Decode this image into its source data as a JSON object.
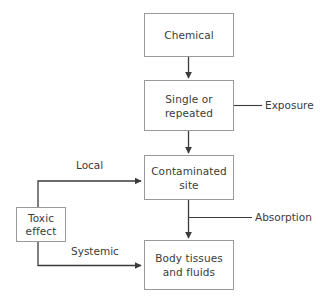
{
  "diagram": {
    "type": "flowchart",
    "colors": {
      "box_border": "#9a9a9a",
      "arrow": "#3b3b3b",
      "text": "#3b3b3b",
      "background": "#ffffff"
    },
    "nodes": [
      {
        "id": "chemical",
        "label": "Chemical"
      },
      {
        "id": "exposure",
        "label": "Single or\nrepeated"
      },
      {
        "id": "contaminated",
        "label": "Contaminated\nsite"
      },
      {
        "id": "body",
        "label": "Body tissues\nand fluids"
      },
      {
        "id": "toxic",
        "label": "Toxic\neffect"
      }
    ],
    "edge_labels": [
      {
        "id": "local",
        "label": "Local"
      },
      {
        "id": "systemic",
        "label": "Systemic"
      }
    ],
    "callouts": [
      {
        "id": "exposure-callout",
        "label": "Exposure"
      },
      {
        "id": "absorption-callout",
        "label": "Absorption"
      }
    ],
    "connections": [
      {
        "from": "chemical",
        "to": "exposure",
        "label": ""
      },
      {
        "from": "exposure",
        "to": "contaminated",
        "label": ""
      },
      {
        "from": "contaminated",
        "to": "body",
        "label": ""
      },
      {
        "from": "toxic",
        "to": "contaminated",
        "label": "Local"
      },
      {
        "from": "toxic",
        "to": "body",
        "label": "Systemic"
      }
    ]
  }
}
